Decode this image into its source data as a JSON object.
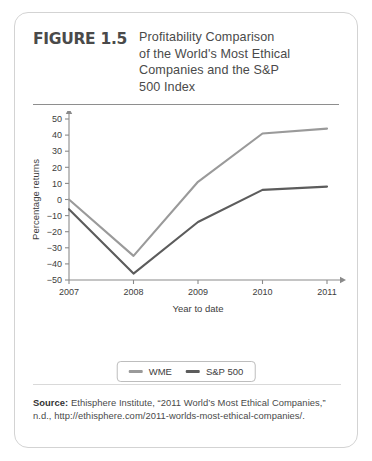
{
  "figure": {
    "number_label": "FIGURE 1.5",
    "title": "Profitability Comparison of the World's Most Ethical Companies and the S&P 500 Index",
    "title_lines": [
      "Profitability Comparison",
      "of the World's Most Ethical",
      "Companies and the S&P",
      "500 Index"
    ]
  },
  "source": {
    "label": "Source:",
    "text": " Ethisphere Institute, “2011 World’s Most Ethical Companies,” n.d., http://ethisphere.com/2011-worlds-most-ethical-companies/."
  },
  "colors": {
    "wme_line": "#9a9a9a",
    "sp500_line": "#5c5c5c",
    "axis": "#8a8a8a",
    "card_border": "#d3d3d3",
    "text": "#4a4a4a"
  },
  "chart_data": {
    "type": "line",
    "title": "Profitability Comparison of the World's Most Ethical Companies and the S&P 500 Index",
    "xlabel": "Year to date",
    "ylabel": "Percentage returns",
    "categories": [
      "2007",
      "2008",
      "2009",
      "2010",
      "2011"
    ],
    "x": [
      2007,
      2008,
      2009,
      2010,
      2011
    ],
    "xlim": [
      2007,
      2011
    ],
    "ylim": [
      -50,
      50
    ],
    "yticks": [
      50,
      40,
      30,
      20,
      10,
      0,
      -10,
      -20,
      -30,
      -40,
      -50
    ],
    "ytick_labels": [
      "50",
      "40",
      "30",
      "20",
      "10",
      "0",
      "−10",
      "−20",
      "−30",
      "−40",
      "−50"
    ],
    "grid": false,
    "legend_position": "bottom-center",
    "series": [
      {
        "name": "WME",
        "color": "#9a9a9a",
        "values": [
          0,
          -35,
          11,
          41,
          44
        ]
      },
      {
        "name": "S&P 500",
        "color": "#5c5c5c",
        "values": [
          -6,
          -46,
          -14,
          6,
          8
        ]
      }
    ]
  }
}
